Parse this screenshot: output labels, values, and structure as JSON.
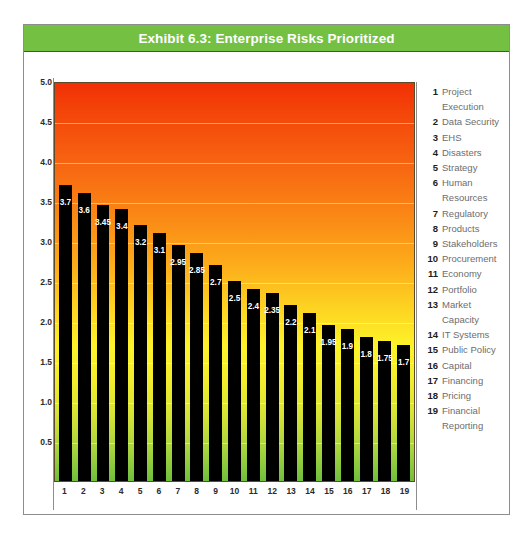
{
  "title": "Exhibit 6.3: Enterprise Risks Prioritized",
  "colors": {
    "banner_green": "#74c043",
    "bar_black": "#000000",
    "legend_number": "#1d1d1d",
    "legend_label": "#6d6d6d",
    "frame_border": "#8d8d8d",
    "gradient_top": "#f23005",
    "gradient_mid": "#fdf329",
    "gradient_bottom": "#6fbf3c"
  },
  "chart_data": {
    "type": "bar",
    "title": "Exhibit 6.3: Enterprise Risks Prioritized",
    "xlabel": "",
    "ylabel": "",
    "ylim": [
      0,
      5.0
    ],
    "grid": true,
    "legend_position": "right",
    "y_ticks": [
      "5.0",
      "4.5",
      "4.0",
      "3.5",
      "3.0",
      "2.5",
      "2.0",
      "1.5",
      "1.0",
      "0.5"
    ],
    "y_tick_values": [
      5.0,
      4.5,
      4.0,
      3.5,
      3.0,
      2.5,
      2.0,
      1.5,
      1.0,
      0.5
    ],
    "categories": [
      "1",
      "2",
      "3",
      "4",
      "5",
      "6",
      "7",
      "8",
      "9",
      "10",
      "11",
      "12",
      "13",
      "14",
      "15",
      "16",
      "17",
      "18",
      "19"
    ],
    "values": [
      3.7,
      3.6,
      3.45,
      3.4,
      3.2,
      3.1,
      2.95,
      2.85,
      2.7,
      2.5,
      2.4,
      2.35,
      2.2,
      2.1,
      1.95,
      1.9,
      1.8,
      1.75,
      1.7
    ],
    "value_labels": [
      "3.7",
      "3.6",
      "3.45",
      "3.4",
      "3.2",
      "3.1",
      "2.95",
      "2.85",
      "2.7",
      "2.5",
      "2.4",
      "2.35",
      "2.2",
      "2.1",
      "1.95",
      "1.9",
      "1.8",
      "1.75",
      "1.7"
    ],
    "series_names": [
      "Project Execution",
      "Data Security",
      "EHS",
      "Disasters",
      "Strategy",
      "Human Resources",
      "Regulatory",
      "Products",
      "Stakeholders",
      "Procurement",
      "Economy",
      "Portfolio",
      "Market Capacity",
      "IT Systems",
      "Public Policy",
      "Capital",
      "Financing",
      "Pricing",
      "Financial Reporting"
    ]
  },
  "legend": {
    "items": [
      {
        "num": "1",
        "label": "Project\nExecution"
      },
      {
        "num": "2",
        "label": "Data Security"
      },
      {
        "num": "3",
        "label": "EHS"
      },
      {
        "num": "4",
        "label": "Disasters"
      },
      {
        "num": "5",
        "label": "Strategy"
      },
      {
        "num": "6",
        "label": "Human\nResources"
      },
      {
        "num": "7",
        "label": "Regulatory"
      },
      {
        "num": "8",
        "label": "Products"
      },
      {
        "num": "9",
        "label": "Stakeholders"
      },
      {
        "num": "10",
        "label": "Procurement"
      },
      {
        "num": "11",
        "label": "Economy"
      },
      {
        "num": "12",
        "label": "Portfolio"
      },
      {
        "num": "13",
        "label": "Market\nCapacity"
      },
      {
        "num": "14",
        "label": "IT Systems"
      },
      {
        "num": "15",
        "label": "Public Policy"
      },
      {
        "num": "16",
        "label": "Capital"
      },
      {
        "num": "17",
        "label": "Financing"
      },
      {
        "num": "18",
        "label": "Pricing"
      },
      {
        "num": "19",
        "label": "Financial\nReporting"
      }
    ]
  }
}
